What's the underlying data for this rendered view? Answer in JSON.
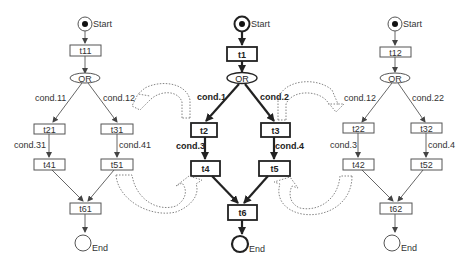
{
  "diagram": {
    "type": "petri-net-workflow-comparison",
    "left_net": {
      "start_label": "Start",
      "end_label": "End",
      "transitions": [
        "t11",
        "t21",
        "t31",
        "t41",
        "t51",
        "t61"
      ],
      "split_label": "OR",
      "conditions": [
        "cond.11",
        "cond.12",
        "cond.31",
        "cond.41"
      ]
    },
    "center_net": {
      "start_label": "Start",
      "end_label": "End",
      "transitions": [
        "t1",
        "t2",
        "t3",
        "t4",
        "t5",
        "t6"
      ],
      "split_label": "OR",
      "conditions": [
        "cond.1",
        "cond.2",
        "cond.3",
        "cond.4"
      ]
    },
    "right_net": {
      "start_label": "Start",
      "end_label": "End",
      "transitions": [
        "t12",
        "t22",
        "t32",
        "t42",
        "t52",
        "t62"
      ],
      "split_label": "OR",
      "conditions": [
        "cond.12",
        "cond.22",
        "cond.3",
        "cond.4"
      ]
    },
    "colors": {
      "line": "#555555",
      "bold_line": "#222222",
      "dotted_arrow": "#777777",
      "background": "#ffffff"
    }
  }
}
